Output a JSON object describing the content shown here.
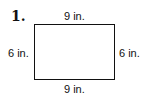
{
  "problem": {
    "number": "1.",
    "shape": "rectangle",
    "labels": {
      "top": "9 in.",
      "bottom": "9 in.",
      "left": "6 in.",
      "right": "6 in."
    }
  }
}
